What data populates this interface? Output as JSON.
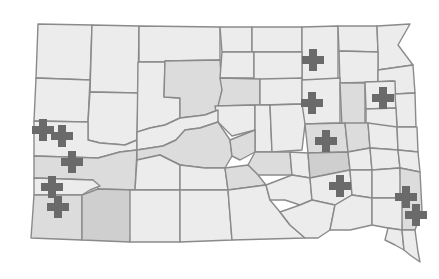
{
  "map": {
    "region": "South Dakota counties",
    "colors": {
      "background": "#ffffff",
      "border": "#8a8a8a",
      "shade_light": "#ececec",
      "shade_mid": "#dcdcdc",
      "shade_dark": "#cfcfcf",
      "marker": "#6a6a6a"
    },
    "counties": [
      {
        "points": "38,24 92,25 90,80 36,78",
        "shade": "shade_light"
      },
      {
        "points": "92,25 139,26 138,93 90,92",
        "shade": "shade_light"
      },
      {
        "points": "139,26 220,27 220,60 165,61 164,62 139,62",
        "shade": "shade_light"
      },
      {
        "points": "36,78 90,80 88,122 34,121",
        "shade": "shade_light"
      },
      {
        "points": "90,92 138,93 137,140 125,145 100,143 88,140 88,122",
        "shade": "shade_light"
      },
      {
        "points": "138,62 165,62 164,97 180,98 180,118 165,125 150,128 138,132 137,140",
        "shade": "shade_light"
      },
      {
        "points": "165,61 220,60 222,90 218,110 205,115 180,118 180,98 164,97",
        "shade": "shade_mid"
      },
      {
        "points": "220,27 252,27 252,52 222,52",
        "shade": "shade_light"
      },
      {
        "points": "252,27 302,27 302,52 252,52",
        "shade": "shade_light"
      },
      {
        "points": "302,27 338,26 338,80 302,80 302,52",
        "shade": "shade_light"
      },
      {
        "points": "338,26 377,26 378,52 339,51",
        "shade": "shade_light"
      },
      {
        "points": "377,26 410,24 398,45 413,65 378,70 378,52",
        "shade": "shade_light"
      },
      {
        "points": "222,52 254,52 254,78 220,78",
        "shade": "shade_light"
      },
      {
        "points": "254,52 302,52 302,80 254,80",
        "shade": "shade_light"
      },
      {
        "points": "339,51 378,52 378,82 340,83",
        "shade": "shade_light"
      },
      {
        "points": "378,70 413,65 415,93 395,94 393,81 378,82",
        "shade": "shade_light"
      },
      {
        "points": "220,78 260,79 260,105 218,106 222,90",
        "shade": "shade_mid"
      },
      {
        "points": "260,79 302,78 302,104 260,105",
        "shade": "shade_light"
      },
      {
        "points": "302,80 340,78 340,123 302,124",
        "shade": "shade_light"
      },
      {
        "points": "340,83 365,83 365,127 342,127",
        "shade": "shade_mid"
      },
      {
        "points": "365,82 395,81 396,108 366,109",
        "shade": "shade_light"
      },
      {
        "points": "395,94 415,93 416,127 397,127",
        "shade": "shade_light"
      },
      {
        "points": "366,109 396,108 397,127 366,128",
        "shade": "shade_light"
      },
      {
        "points": "215,106 255,105 255,130 232,136 218,122",
        "shade": "shade_light"
      },
      {
        "points": "255,105 270,105 272,152 255,152 255,130",
        "shade": "shade_light"
      },
      {
        "points": "270,105 302,104 305,124 302,150 272,152",
        "shade": "shade_light"
      },
      {
        "points": "305,124 345,123 348,152 308,153",
        "shade": "shade_mid"
      },
      {
        "points": "345,123 368,123 370,148 348,152",
        "shade": "shade_mid"
      },
      {
        "points": "368,123 397,127 398,150 370,148",
        "shade": "shade_light"
      },
      {
        "points": "397,127 417,127 418,152 398,150",
        "shade": "shade_light"
      },
      {
        "points": "34,121 88,122 88,140 100,143 125,145 137,140 137,150 120,152 98,158 34,156",
        "shade": "shade_light"
      },
      {
        "points": "137,132 150,128 165,125 180,118 205,115 218,110 218,122 200,128 185,130 176,140 163,146 137,150",
        "shade": "shade_light"
      },
      {
        "points": "34,156 98,158 120,152 137,150 135,190 98,189 93,180 34,178",
        "shade": "shade_mid"
      },
      {
        "points": "34,178 93,180 100,186 90,190 82,195 34,195",
        "shade": "shade_light"
      },
      {
        "points": "137,150 163,146 176,140 185,130 200,128 218,122 230,140 232,156 225,168 205,168 180,165 160,155 137,160",
        "shade": "shade_mid"
      },
      {
        "points": "230,140 255,130 255,152 240,160 232,156",
        "shade": "shade_mid"
      },
      {
        "points": "255,152 290,152 292,175 258,175 248,165",
        "shade": "shade_mid"
      },
      {
        "points": "290,152 308,153 310,178 292,175",
        "shade": "shade_light"
      },
      {
        "points": "308,153 348,152 350,170 310,178",
        "shade": "shade_dark"
      },
      {
        "points": "348,152 370,148 372,170 350,170",
        "shade": "shade_light"
      },
      {
        "points": "370,148 398,150 400,168 372,170",
        "shade": "shade_light"
      },
      {
        "points": "398,150 418,152 420,172 400,168",
        "shade": "shade_light"
      },
      {
        "points": "34,195 82,195 82,240 31,238",
        "shade": "shade_mid"
      },
      {
        "points": "82,195 98,189 135,190 130,242 82,240",
        "shade": "shade_dark"
      },
      {
        "points": "137,160 160,155 180,165 180,190 130,190 135,190",
        "shade": "shade_light"
      },
      {
        "points": "130,190 180,190 180,242 130,242",
        "shade": "shade_light"
      },
      {
        "points": "180,165 205,168 225,168 228,190 180,190",
        "shade": "shade_light"
      },
      {
        "points": "180,190 228,190 232,240 180,242",
        "shade": "shade_light"
      },
      {
        "points": "225,168 248,165 258,175 266,185 228,190",
        "shade": "shade_mid"
      },
      {
        "points": "228,190 266,185 270,200 280,212 290,225 305,238 232,240",
        "shade": "shade_light"
      },
      {
        "points": "266,185 292,175 310,178 312,200 300,205 285,200 270,200",
        "shade": "shade_light"
      },
      {
        "points": "310,178 350,170 352,195 335,205 312,200",
        "shade": "shade_light"
      },
      {
        "points": "350,170 372,170 372,198 352,195",
        "shade": "shade_light"
      },
      {
        "points": "372,170 400,168 402,198 372,198",
        "shade": "shade_light"
      },
      {
        "points": "400,168 420,172 422,210 415,230 402,230 400,198",
        "shade": "shade_mid"
      },
      {
        "points": "300,205 312,200 335,205 330,230 318,238 305,238 290,225 280,212",
        "shade": "shade_light"
      },
      {
        "points": "335,205 352,195 372,198 372,225 350,230 330,230",
        "shade": "shade_light"
      },
      {
        "points": "372,198 402,198 402,230 388,228 372,225",
        "shade": "shade_light"
      },
      {
        "points": "388,228 402,230 404,250 395,245 385,240",
        "shade": "shade_light"
      },
      {
        "points": "402,230 415,230 418,252 420,262 410,255 404,250",
        "shade": "shade_light"
      }
    ],
    "markers": [
      {
        "x": 313,
        "y": 60
      },
      {
        "x": 312,
        "y": 103
      },
      {
        "x": 383,
        "y": 98
      },
      {
        "x": 326,
        "y": 141
      },
      {
        "x": 340,
        "y": 186
      },
      {
        "x": 406,
        "y": 197
      },
      {
        "x": 416,
        "y": 215
      },
      {
        "x": 43,
        "y": 130
      },
      {
        "x": 62,
        "y": 136
      },
      {
        "x": 72,
        "y": 162
      },
      {
        "x": 52,
        "y": 187
      },
      {
        "x": 58,
        "y": 207
      }
    ],
    "marker_icon": "plus-icon"
  }
}
